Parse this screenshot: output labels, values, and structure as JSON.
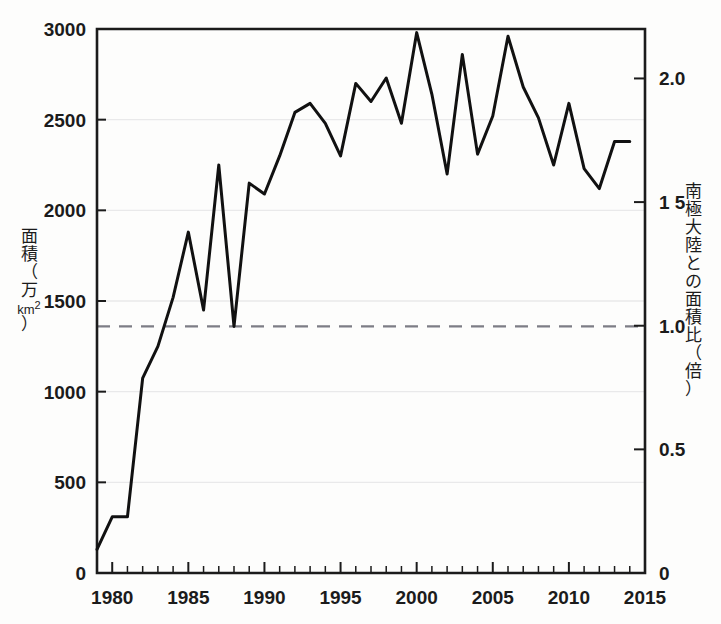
{
  "chart_data": {
    "type": "line",
    "title": "",
    "subtitle": "",
    "xlabel": "",
    "ylabel": "面積（万km²）",
    "y2label": "南極大陸との面積比（倍）",
    "xlim": [
      1979,
      2015
    ],
    "ylim": [
      0,
      3000
    ],
    "y2lim": [
      0,
      2.2
    ],
    "grid": true,
    "legend": null,
    "x_ticks": [
      1980,
      1985,
      1990,
      1995,
      2000,
      2005,
      2010,
      2015
    ],
    "x_tick_labels": [
      "1980",
      "1985",
      "1990",
      "1995",
      "2000",
      "2005",
      "2010",
      "2015"
    ],
    "x_minor_tick_step": 1,
    "y_ticks": [
      0,
      500,
      1000,
      1500,
      2000,
      2500,
      3000
    ],
    "y_tick_labels": [
      "0",
      "500",
      "1000",
      "1500",
      "2000",
      "2500",
      "3000"
    ],
    "y2_ticks": [
      0,
      0.5,
      1.0,
      1.5,
      2.0
    ],
    "y2_tick_labels": [
      "0",
      "0.5",
      "1 5",
      "1.0",
      "2.0"
    ],
    "y2_tick_labels_ordered": [
      "0",
      "0.5",
      "1.0",
      "1 5",
      "2.0"
    ],
    "annotations": [
      {
        "name": "antarctica-reference-line",
        "style": "dashed",
        "y_value": 1360,
        "y2_value": 1.0,
        "label": ""
      }
    ],
    "x": [
      1979,
      1980,
      1981,
      1982,
      1983,
      1984,
      1985,
      1986,
      1987,
      1988,
      1989,
      1990,
      1991,
      1992,
      1993,
      1994,
      1995,
      1996,
      1997,
      1998,
      1999,
      2000,
      2001,
      2002,
      2003,
      2004,
      2005,
      2006,
      2007,
      2008,
      2009,
      2010,
      2011,
      2012,
      2013,
      2014
    ],
    "values": [
      130,
      310,
      310,
      1075,
      1250,
      1520,
      1880,
      1450,
      2250,
      1360,
      2150,
      2090,
      2300,
      2540,
      2590,
      2480,
      2300,
      2700,
      2600,
      2730,
      2480,
      2980,
      2640,
      2200,
      2860,
      2310,
      2520,
      2960,
      2680,
      2510,
      2250,
      2590,
      2230,
      2120,
      2380,
      2380
    ],
    "series": [
      {
        "name": "オゾンホール面積",
        "color": "#111111",
        "line_width": 3,
        "values": [
          130,
          310,
          310,
          1075,
          1250,
          1520,
          1880,
          1450,
          2250,
          1360,
          2150,
          2090,
          2300,
          2540,
          2590,
          2480,
          2300,
          2700,
          2600,
          2730,
          2480,
          2980,
          2640,
          2200,
          2860,
          2310,
          2520,
          2960,
          2680,
          2510,
          2250,
          2590,
          2230,
          2120,
          2380,
          2380
        ]
      }
    ]
  },
  "axes": {
    "left_title_chars": [
      "面",
      "積",
      "（",
      "万",
      "km²",
      "）"
    ],
    "right_title_chars": [
      "南",
      "極",
      "大",
      "陸",
      "と",
      "の",
      "面",
      "積",
      "比",
      "（",
      "倍",
      "）"
    ]
  },
  "colors": {
    "line": "#111111",
    "axis": "#1b1b1b",
    "grid": "#e9e9ea",
    "dashed_reference": "#7d7d85",
    "background": "#fdfdfc",
    "text": "#1b1b1b"
  }
}
